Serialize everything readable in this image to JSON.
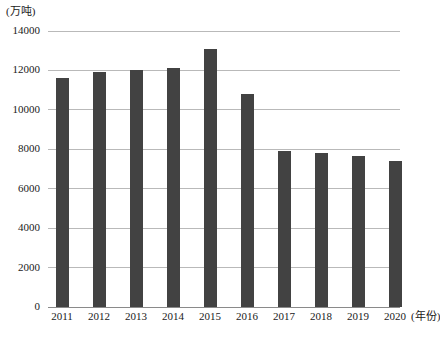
{
  "chart_data": {
    "type": "bar",
    "title": "",
    "subtitle": "",
    "xlabel": "(年份)",
    "ylabel": "(万吨)",
    "categories": [
      "2011",
      "2012",
      "2013",
      "2014",
      "2015",
      "2016",
      "2017",
      "2018",
      "2019",
      "2020"
    ],
    "values": [
      11600,
      11900,
      12000,
      12100,
      13100,
      10800,
      7900,
      7800,
      7650,
      7400
    ],
    "series": [
      {
        "name": "",
        "values": [
          11600,
          11900,
          12000,
          12100,
          13100,
          10800,
          7900,
          7800,
          7650,
          7400
        ]
      }
    ],
    "ylim": [
      0,
      14000
    ],
    "yticks": [
      0,
      2000,
      4000,
      6000,
      8000,
      10000,
      12000,
      14000
    ],
    "ytick_labels": [
      "0",
      "2000",
      "4000",
      "6000",
      "8000",
      "10000",
      "12000",
      "14000"
    ],
    "grid": true,
    "legend": false,
    "legend_position": "none",
    "bar_color": "#424242",
    "grid_color": "#b9b9b9",
    "axis_color": "#8a8a8a",
    "background": "#ffffff"
  }
}
